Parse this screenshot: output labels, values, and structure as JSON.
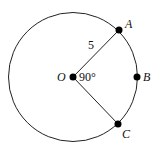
{
  "diagram": {
    "type": "circle-sector",
    "circle": {
      "center": "O",
      "stroke": "#222222"
    },
    "points": [
      {
        "id": "O",
        "label": "O"
      },
      {
        "id": "A",
        "label": "A"
      },
      {
        "id": "B",
        "label": "B"
      },
      {
        "id": "C",
        "label": "C"
      }
    ],
    "radius_label": "5",
    "angle_label": "90°",
    "segments": [
      "OA",
      "OC"
    ]
  }
}
